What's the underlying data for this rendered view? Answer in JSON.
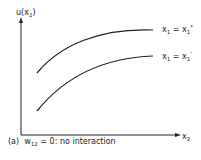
{
  "diagram": {
    "y_axis_label": {
      "base": "u(x",
      "sub": "2",
      "close": ")"
    },
    "x_axis_label": {
      "base": "x",
      "sub": "2"
    },
    "curves": [
      {
        "name": "upper",
        "label": {
          "var": "x",
          "var_sub": "1",
          "eq": " = ",
          "val": "x",
          "val_sub": "1",
          "val_sup": "*"
        }
      },
      {
        "name": "lower",
        "label": {
          "var": "x",
          "var_sub": "1",
          "eq": " = ",
          "val": "x",
          "val_sub": "1",
          "val_sup": "'"
        }
      }
    ],
    "caption": {
      "prefix": "(a)",
      "w": "w",
      "w_sub": "12",
      "rest": " = 0: no interaction"
    }
  }
}
